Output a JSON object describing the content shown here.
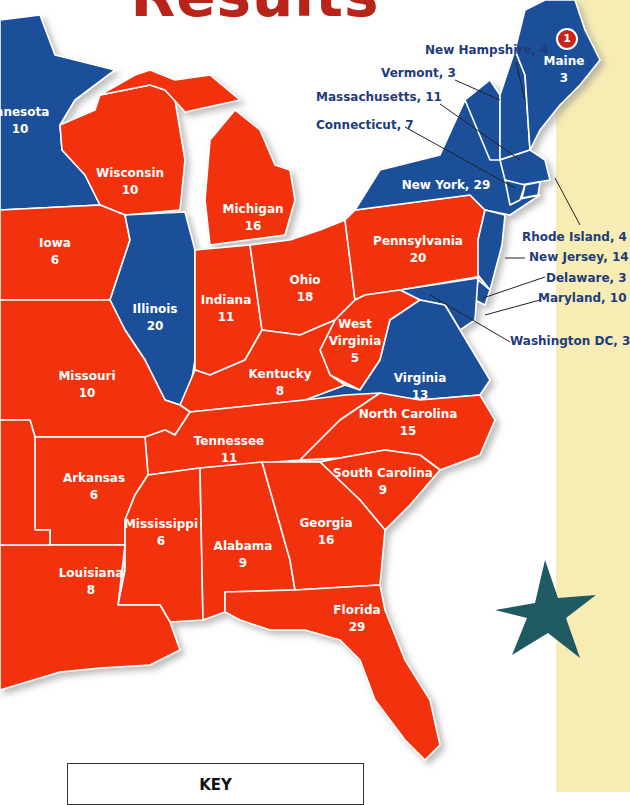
{
  "title": "Results",
  "colors": {
    "republican": "#f2300f",
    "democrat": "#1f4f9a",
    "border": "#ffffff",
    "label_dark": "#1f3c7a",
    "title": "#b8231a",
    "star": "#1f5a63",
    "sidebar": "#f6ecb4"
  },
  "badge": "1",
  "states": {
    "minnesota": {
      "name": "innesota",
      "votes": "10",
      "party": "democrat"
    },
    "wisconsin": {
      "name": "Wisconsin",
      "votes": "10",
      "party": "republican"
    },
    "michigan": {
      "name": "Michigan",
      "votes": "16",
      "party": "republican"
    },
    "iowa": {
      "name": "Iowa",
      "votes": "6",
      "party": "republican"
    },
    "illinois": {
      "name": "Illinois",
      "votes": "20",
      "party": "democrat"
    },
    "indiana": {
      "name": "Indiana",
      "votes": "11",
      "party": "republican"
    },
    "ohio": {
      "name": "Ohio",
      "votes": "18",
      "party": "republican"
    },
    "pennsylvania": {
      "name": "Pennsylvania",
      "votes": "20",
      "party": "republican"
    },
    "west_virginia": {
      "name": "West Virginia",
      "name1": "West",
      "name2": "Virginia",
      "votes": "5",
      "party": "republican"
    },
    "virginia": {
      "name": "Virginia",
      "votes": "13",
      "party": "democrat"
    },
    "kentucky": {
      "name": "Kentucky",
      "votes": "8",
      "party": "republican"
    },
    "missouri": {
      "name": "Missouri",
      "votes": "10",
      "party": "republican"
    },
    "tennessee": {
      "name": "Tennessee",
      "votes": "11",
      "party": "republican"
    },
    "north_carolina": {
      "name": "North Carolina",
      "votes": "15",
      "party": "republican"
    },
    "south_carolina": {
      "name": "South Carolina",
      "votes": "9",
      "party": "republican"
    },
    "arkansas": {
      "name": "Arkansas",
      "votes": "6",
      "party": "republican"
    },
    "mississippi": {
      "name": "Mississippi",
      "votes": "6",
      "party": "republican"
    },
    "alabama": {
      "name": "Alabama",
      "votes": "9",
      "party": "republican"
    },
    "georgia": {
      "name": "Georgia",
      "votes": "16",
      "party": "republican"
    },
    "louisiana": {
      "name": "Louisiana",
      "votes": "8",
      "party": "republican"
    },
    "florida": {
      "name": "Florida",
      "votes": "29",
      "party": "republican"
    },
    "new_york": {
      "name": "New York",
      "votes": "29",
      "label": "New York, 29",
      "party": "democrat"
    },
    "maine": {
      "name": "Maine",
      "votes": "3",
      "party": "democrat"
    }
  },
  "callouts": {
    "new_hampshire": "New Hampshire, 4",
    "vermont": "Vermont, 3",
    "massachusetts": "Massachusetts, 11",
    "connecticut": "Connecticut, 7",
    "rhode_island": "Rhode Island, 4",
    "new_jersey": "New Jersey, 14",
    "delaware": "Delaware, 3",
    "maryland": "Maryland, 10",
    "washington_dc": "Washington DC, 3"
  },
  "key": {
    "title": "KEY"
  }
}
